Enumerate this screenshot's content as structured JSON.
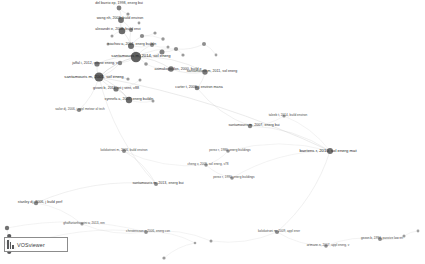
{
  "app": {
    "name": "VOSviewer",
    "logo_label": "VOSviewer",
    "canvas_label": "network-visualization-canvas"
  },
  "chart_data": {
    "type": "scatter",
    "title": "",
    "subtitle": "",
    "xlabel": "",
    "ylabel": "",
    "grid": false,
    "legend": "none",
    "xlim": [
      0,
      425
    ],
    "ylim": [
      0,
      264
    ],
    "nodes": [
      {
        "label": "del barrio ep, 1998, energ bui",
        "x": 119,
        "y": 8,
        "r": 2.4,
        "weight": 3,
        "color": "#6e6e6e"
      },
      {
        "label": "",
        "x": 128,
        "y": 14,
        "r": 1.6,
        "weight": 1,
        "color": "#8a8a8a"
      },
      {
        "label": "wong nh, 2003, build environ",
        "x": 121,
        "y": 20,
        "r": 2.9,
        "weight": 4,
        "color": "#5f5f5f"
      },
      {
        "label": "",
        "x": 139,
        "y": 23,
        "r": 1.4,
        "weight": 1,
        "color": "#909090"
      },
      {
        "label": "alexandri e, 2008, build envi",
        "x": 122,
        "y": 31,
        "r": 3.3,
        "weight": 5,
        "color": "#565656"
      },
      {
        "label": "",
        "x": 131,
        "y": 30,
        "r": 2.0,
        "weight": 2,
        "color": "#7d7d7d"
      },
      {
        "label": "",
        "x": 112,
        "y": 36,
        "r": 1.5,
        "weight": 1,
        "color": "#909090"
      },
      {
        "label": "",
        "x": 142,
        "y": 36,
        "r": 2.1,
        "weight": 2,
        "color": "#7a7a7a"
      },
      {
        "label": "",
        "x": 155,
        "y": 33,
        "r": 1.6,
        "weight": 1,
        "color": "#8d8d8d"
      },
      {
        "label": "",
        "x": 163,
        "y": 39,
        "r": 1.7,
        "weight": 1,
        "color": "#8a8a8a"
      },
      {
        "label": "niachou a, 2001, energ buildin",
        "x": 131,
        "y": 46,
        "r": 3.0,
        "weight": 4,
        "color": "#5b5b5b"
      },
      {
        "label": "",
        "x": 108,
        "y": 44,
        "r": 1.5,
        "weight": 1,
        "color": "#949494"
      },
      {
        "label": "",
        "x": 152,
        "y": 45,
        "r": 2.0,
        "weight": 2,
        "color": "#7e7e7e"
      },
      {
        "label": "",
        "x": 168,
        "y": 47,
        "r": 1.5,
        "weight": 1,
        "color": "#909090"
      },
      {
        "label": "santamouris m, 2014, sol energ",
        "x": 136,
        "y": 57,
        "r": 5.2,
        "weight": 9,
        "color": "#4a4a4a"
      },
      {
        "label": "",
        "x": 162,
        "y": 52,
        "r": 2.5,
        "weight": 3,
        "color": "#6f6f6f"
      },
      {
        "label": "",
        "x": 176,
        "y": 49,
        "r": 2.1,
        "weight": 2,
        "color": "#7c7c7c"
      },
      {
        "label": "",
        "x": 183,
        "y": 55,
        "r": 1.6,
        "weight": 1,
        "color": "#8d8d8d"
      },
      {
        "label": "",
        "x": 204,
        "y": 44,
        "r": 2.0,
        "weight": 2,
        "color": "#808080"
      },
      {
        "label": "",
        "x": 216,
        "y": 55,
        "r": 1.4,
        "weight": 1,
        "color": "#959595"
      },
      {
        "label": "jaffal i, 2012, renew energ, v",
        "x": 97,
        "y": 64,
        "r": 2.6,
        "weight": 3,
        "color": "#666666"
      },
      {
        "label": "",
        "x": 120,
        "y": 63,
        "r": 2.2,
        "weight": 2,
        "color": "#777777"
      },
      {
        "label": "",
        "x": 146,
        "y": 64,
        "r": 1.8,
        "weight": 1,
        "color": "#878787"
      },
      {
        "label": "asimakopoulos, 2000, build e",
        "x": 171,
        "y": 69,
        "r": 2.8,
        "weight": 4,
        "color": "#616161"
      },
      {
        "label": "santamouris m, 2001, sol energ",
        "x": 99,
        "y": 77,
        "r": 4.6,
        "weight": 8,
        "color": "#4f4f4f"
      },
      {
        "label": "santamouris m, 2011, sol energ",
        "x": 205,
        "y": 72,
        "r": 2.7,
        "weight": 3,
        "color": "#646464"
      },
      {
        "label": "",
        "x": 128,
        "y": 79,
        "r": 1.6,
        "weight": 1,
        "color": "#8d8d8d"
      },
      {
        "label": "",
        "x": 140,
        "y": 80,
        "r": 1.5,
        "weight": 1,
        "color": "#909090"
      },
      {
        "label": "givoni b, 2011, int j vent, v88",
        "x": 116,
        "y": 89,
        "r": 2.6,
        "weight": 3,
        "color": "#666666"
      },
      {
        "label": "carter t, 2006, j environ mana",
        "x": 197,
        "y": 88,
        "r": 2.3,
        "weight": 2,
        "color": "#707070"
      },
      {
        "label": "synnefa a, 2007, energ buildin",
        "x": 129,
        "y": 100,
        "r": 3.2,
        "weight": 5,
        "color": "#595959"
      },
      {
        "label": "",
        "x": 153,
        "y": 101,
        "r": 1.5,
        "weight": 1,
        "color": "#909090"
      },
      {
        "label": "sailor dj, 2006, j appl meteor ol tech",
        "x": 79,
        "y": 110,
        "r": 2.1,
        "weight": 2,
        "color": "#7a7a7a"
      },
      {
        "label": "taleeb t, 2014, build environ",
        "x": 284,
        "y": 116,
        "r": 1.6,
        "weight": 1,
        "color": "#8d8d8d"
      },
      {
        "label": "santamouris m, 2007, energ bui",
        "x": 250,
        "y": 126,
        "r": 2.2,
        "weight": 2,
        "color": "#767676"
      },
      {
        "label": "baetens r, 2010, sol energ mat",
        "x": 330,
        "y": 151,
        "r": 3.0,
        "weight": 4,
        "color": "#5b5b5b"
      },
      {
        "label": "kolokotroni m, 2006, build environ",
        "x": 124,
        "y": 151,
        "r": 2.0,
        "weight": 2,
        "color": "#7e7e7e"
      },
      {
        "label": "perez r, 1986, energ buildings",
        "x": 228,
        "y": 151,
        "r": 1.8,
        "weight": 1,
        "color": "#858585"
      },
      {
        "label": "cheng v, 2005, sol energ, v78",
        "x": 206,
        "y": 165,
        "r": 1.7,
        "weight": 1,
        "color": "#888888"
      },
      {
        "label": "santamouris m, 2013, energ bui",
        "x": 156,
        "y": 184,
        "r": 2.0,
        "weight": 2,
        "color": "#7e7e7e"
      },
      {
        "label": "perez r, 1990, energ buildings",
        "x": 232,
        "y": 178,
        "r": 1.8,
        "weight": 1,
        "color": "#858585"
      },
      {
        "label": "stanley dj, 2006, j build perf",
        "x": 36,
        "y": 203,
        "r": 2.2,
        "weight": 2,
        "color": "#767676"
      },
      {
        "label": "ghaffarianhoseini a, 2013, ren",
        "x": 82,
        "y": 224,
        "r": 1.6,
        "weight": 1,
        "color": "#8d8d8d"
      },
      {
        "label": "christensson r, 2006, energ con",
        "x": 146,
        "y": 232,
        "r": 1.9,
        "weight": 1,
        "color": "#838383"
      },
      {
        "label": "kolokotroni m, 2009, appl ener",
        "x": 277,
        "y": 232,
        "r": 2.1,
        "weight": 2,
        "color": "#7c7c7c"
      },
      {
        "label": "",
        "x": 211,
        "y": 241,
        "r": 1.5,
        "weight": 1,
        "color": "#909090"
      },
      {
        "label": "artmann n, 2007, appl energ, v",
        "x": 326,
        "y": 246,
        "r": 1.8,
        "weight": 1,
        "color": "#858585"
      },
      {
        "label": "gezon b, 1994, passive low en",
        "x": 380,
        "y": 239,
        "r": 2.0,
        "weight": 2,
        "color": "#808080"
      },
      {
        "label": "",
        "x": 404,
        "y": 236,
        "r": 1.5,
        "weight": 1,
        "color": "#909090"
      },
      {
        "label": "",
        "x": 418,
        "y": 231,
        "r": 1.4,
        "weight": 1,
        "color": "#959595"
      },
      {
        "label": "",
        "x": 7,
        "y": 228,
        "r": 2.2,
        "weight": 2,
        "color": "#5f5f5f"
      },
      {
        "label": "",
        "x": 7,
        "y": 243,
        "r": 1.9,
        "weight": 1,
        "color": "#6a6a6a"
      },
      {
        "label": "",
        "x": 15,
        "y": 248,
        "r": 1.5,
        "weight": 1,
        "color": "#8a8a8a"
      },
      {
        "label": "",
        "x": 195,
        "y": 243,
        "r": 1.3,
        "weight": 1,
        "color": "#999999"
      },
      {
        "label": "",
        "x": 164,
        "y": 258,
        "r": 1.6,
        "weight": 1,
        "color": "#8d8d8d"
      }
    ],
    "labels": [
      {
        "text": "del barrio ep, 1998, energ bui",
        "x": 119,
        "y": 4,
        "size": 2
      },
      {
        "text": "wong nh, 2003, build environ",
        "x": 120,
        "y": 19,
        "size": 2
      },
      {
        "text": "alexandri e, 2008, build envi",
        "x": 118,
        "y": 30,
        "size": 2
      },
      {
        "text": "niachou a, 2001, energ buildin",
        "x": 132,
        "y": 45,
        "size": 2
      },
      {
        "text": "santamouris m, 2014, sol energ",
        "x": 141,
        "y": 56,
        "size": 3
      },
      {
        "text": "jaffal i, 2012, renew energ, v",
        "x": 95,
        "y": 64,
        "size": 2
      },
      {
        "text": "asimakopoulos, 2000, build e",
        "x": 178,
        "y": 70,
        "size": 2
      },
      {
        "text": "santamouris m, 2001, sol energ",
        "x": 94,
        "y": 77,
        "size": 3
      },
      {
        "text": "santamouris m, 2011, sol energ",
        "x": 212,
        "y": 72,
        "size": 2
      },
      {
        "text": "givoni b, 2011, int j vent, v88",
        "x": 116,
        "y": 89,
        "size": 2
      },
      {
        "text": "carter t, 2006, j environ mana",
        "x": 199,
        "y": 88,
        "size": 2
      },
      {
        "text": "synnefa a, 2007, energ buildin",
        "x": 129,
        "y": 100,
        "size": 2
      },
      {
        "text": "sailor dj, 2006, j appl meteor ol tech",
        "x": 80,
        "y": 110,
        "size": 1
      },
      {
        "text": "taleeb t, 2014, build environ",
        "x": 288,
        "y": 116,
        "size": 1
      },
      {
        "text": "santamouris m, 2007, energ bui",
        "x": 254,
        "y": 126,
        "size": 2
      },
      {
        "text": "baetens r, 2010, sol energ mat",
        "x": 328,
        "y": 151,
        "size": 3
      },
      {
        "text": "kolokotroni m, 2006, build environ",
        "x": 124,
        "y": 151,
        "size": 1
      },
      {
        "text": "perez r, 1986, energ buildings",
        "x": 230,
        "y": 151,
        "size": 1
      },
      {
        "text": "cheng v, 2005, sol energ, v78",
        "x": 208,
        "y": 165,
        "size": 1
      },
      {
        "text": "santamouris m, 2013, energ bui",
        "x": 158,
        "y": 184,
        "size": 2
      },
      {
        "text": "perez r, 1990, energ buildings",
        "x": 234,
        "y": 178,
        "size": 1
      },
      {
        "text": "stanley dj, 2006, j build perf",
        "x": 40,
        "y": 203,
        "size": 2
      },
      {
        "text": "ghaffarianhoseini a, 2013, ren",
        "x": 84,
        "y": 224,
        "size": 1
      },
      {
        "text": "christensson r, 2006, energ con",
        "x": 148,
        "y": 232,
        "size": 1
      },
      {
        "text": "kolokotroni m, 2009, appl ener",
        "x": 279,
        "y": 232,
        "size": 1
      },
      {
        "text": "artmann n, 2007, appl energ, v",
        "x": 328,
        "y": 246,
        "size": 1
      },
      {
        "text": "gezon b, 1994, passive low en",
        "x": 382,
        "y": 239,
        "size": 1
      }
    ],
    "edges": [
      [
        0,
        2
      ],
      [
        0,
        1
      ],
      [
        1,
        2
      ],
      [
        2,
        4
      ],
      [
        2,
        5
      ],
      [
        4,
        5
      ],
      [
        4,
        10
      ],
      [
        5,
        10
      ],
      [
        6,
        4
      ],
      [
        7,
        10
      ],
      [
        8,
        7
      ],
      [
        9,
        7
      ],
      [
        10,
        14
      ],
      [
        10,
        12
      ],
      [
        11,
        10
      ],
      [
        12,
        14
      ],
      [
        13,
        12
      ],
      [
        14,
        15
      ],
      [
        14,
        16
      ],
      [
        15,
        16
      ],
      [
        16,
        17
      ],
      [
        14,
        20
      ],
      [
        20,
        21
      ],
      [
        21,
        14
      ],
      [
        14,
        22
      ],
      [
        22,
        23
      ],
      [
        18,
        16
      ],
      [
        19,
        18
      ],
      [
        24,
        20
      ],
      [
        24,
        21
      ],
      [
        24,
        14
      ],
      [
        24,
        28
      ],
      [
        28,
        30
      ],
      [
        30,
        31
      ],
      [
        24,
        30
      ],
      [
        26,
        24
      ],
      [
        27,
        28
      ],
      [
        23,
        25
      ],
      [
        25,
        29
      ],
      [
        23,
        14
      ],
      [
        14,
        25
      ],
      [
        32,
        24
      ],
      [
        24,
        26
      ],
      [
        34,
        33
      ],
      [
        34,
        35
      ],
      [
        35,
        37
      ],
      [
        35,
        44
      ],
      [
        36,
        38
      ],
      [
        37,
        38
      ],
      [
        38,
        40
      ],
      [
        36,
        39
      ],
      [
        39,
        41
      ],
      [
        41,
        42
      ],
      [
        42,
        43
      ],
      [
        43,
        45
      ],
      [
        44,
        46
      ],
      [
        46,
        47
      ],
      [
        47,
        48
      ],
      [
        48,
        49
      ],
      [
        35,
        24
      ],
      [
        39,
        24
      ],
      [
        43,
        50
      ],
      [
        50,
        51
      ],
      [
        51,
        52
      ],
      [
        52,
        43
      ],
      [
        53,
        43
      ],
      [
        54,
        53
      ],
      [
        29,
        34
      ],
      [
        33,
        35
      ],
      [
        45,
        44
      ],
      [
        40,
        35
      ],
      [
        31,
        30
      ]
    ]
  }
}
